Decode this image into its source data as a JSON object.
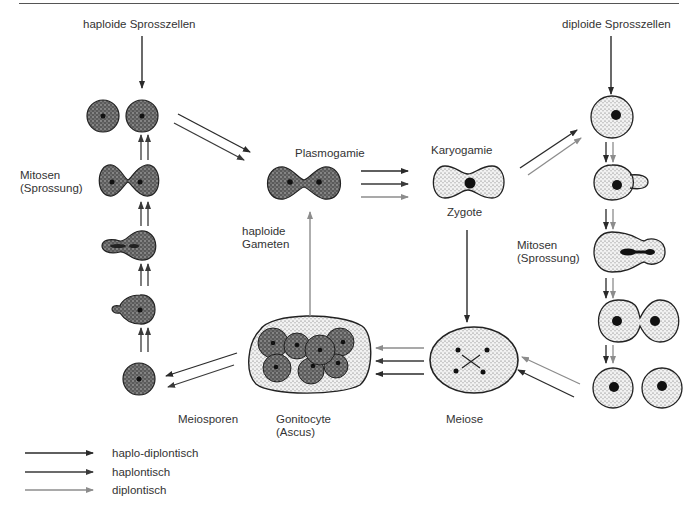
{
  "labels": {
    "haploid_budding": "haploide Sprosszellen",
    "diploid_budding": "diploide Sprosszellen",
    "mitosis_left_1": "Mitosen",
    "mitosis_left_2": "(Sprossung)",
    "mitosis_right_1": "Mitosen",
    "mitosis_right_2": "(Sprossung)",
    "plasmogamy": "Plasmogamie",
    "karyogamy": "Karyogamie",
    "zygote": "Zygote",
    "haploid_gametes_1": "haploide",
    "haploid_gametes_2": "Gameten",
    "meiospores": "Meiosporen",
    "gonitocyte_1": "Gonitocyte",
    "gonitocyte_2": "(Ascus)",
    "meiosis": "Meiose"
  },
  "legend": [
    {
      "label": "haplo-diplontisch",
      "color": "#2a2a2a"
    },
    {
      "label": "haplontisch",
      "color": "#3a3a3a"
    },
    {
      "label": "diplontisch",
      "color": "#8c8c8c"
    }
  ],
  "colors": {
    "haplo_diplontic": "#2a2a2a",
    "haplontic": "#3a3a3a",
    "diplontic": "#8c8c8c",
    "haploid_cell_fill": "#6a6a6a",
    "diploid_cell_fill": "#d8d8d8"
  }
}
